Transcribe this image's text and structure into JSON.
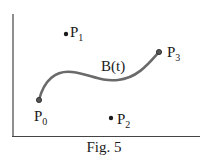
{
  "figure": {
    "caption": "Fig. 5",
    "curve_label": "B(t)",
    "points": [
      {
        "name": "P",
        "sub": "0"
      },
      {
        "name": "P",
        "sub": "1"
      },
      {
        "name": "P",
        "sub": "2"
      },
      {
        "name": "P",
        "sub": "3"
      }
    ],
    "colors": {
      "curve": "#6a6a6a",
      "ink": "#1a1a1a"
    }
  }
}
